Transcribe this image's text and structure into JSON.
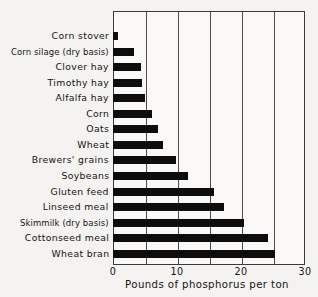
{
  "chart_data": {
    "type": "bar",
    "orientation": "horizontal",
    "title": "",
    "subtitle": "",
    "xlabel": "Pounds of phosphorus per ton",
    "ylabel": "",
    "xlim": [
      0,
      30
    ],
    "xticks": [
      0,
      10,
      20,
      30
    ],
    "xtick_labels": [
      "0",
      "10",
      "20",
      "30"
    ],
    "gridlines_x": [
      5,
      10,
      15,
      20,
      25
    ],
    "grid": true,
    "legend": "none",
    "bar_color": "#0d0d0d",
    "categories": [
      "Corn stover",
      "Corn silage (dry basis)",
      "Clover hay",
      "Timothy hay",
      "Alfalfa hay",
      "Corn",
      "Oats",
      "Wheat",
      "Brewers' grains",
      "Soybeans",
      "Gluten feed",
      "Linseed meal",
      "Skimmilk (dry basis)",
      "Cottonseed meal",
      "Wheat bran"
    ],
    "values": [
      0.8,
      3.3,
      4.4,
      4.5,
      5.0,
      6.1,
      7.0,
      7.8,
      9.8,
      11.7,
      15.8,
      17.3,
      20.5,
      24.2,
      25.3
    ]
  },
  "axis": {
    "x_caption": "Pounds of phosphorus per ton"
  }
}
